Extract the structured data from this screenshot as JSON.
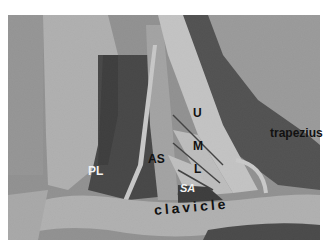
{
  "figure": {
    "labels": {
      "trapezius": "trapezius",
      "upper_trunk": "U",
      "middle_trunk": "M",
      "lower_trunk": "L",
      "anterior_scalene": "AS",
      "phrenic_lateral": "PL",
      "subclavian_artery": "SA",
      "clavicle": "clavicle"
    }
  }
}
